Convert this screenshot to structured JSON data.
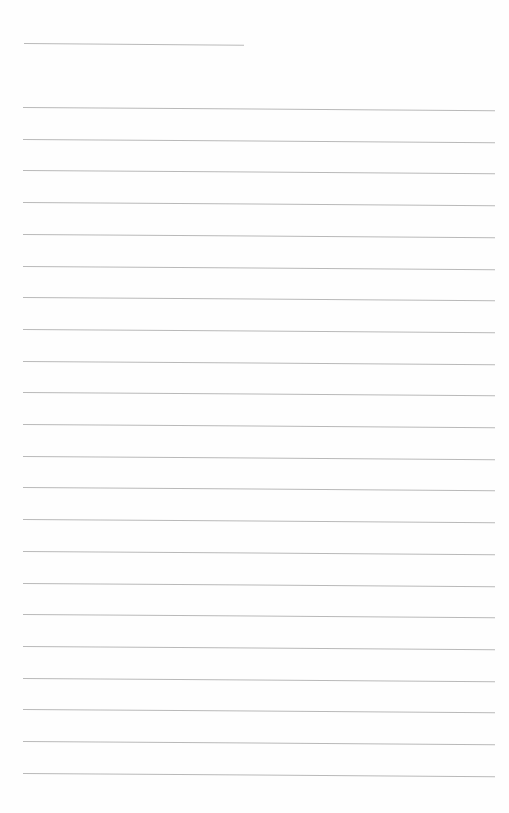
{
  "document": {
    "type": "blank lined page",
    "title_line": {
      "x": 24,
      "y": 43,
      "width": 220
    },
    "ruled_lines": {
      "count": 22,
      "first_y": 107,
      "spacing": 31.7,
      "left_x": 23,
      "right_x": 495
    },
    "line_color": "#b9b9b9",
    "background_color": "#fefefe"
  }
}
